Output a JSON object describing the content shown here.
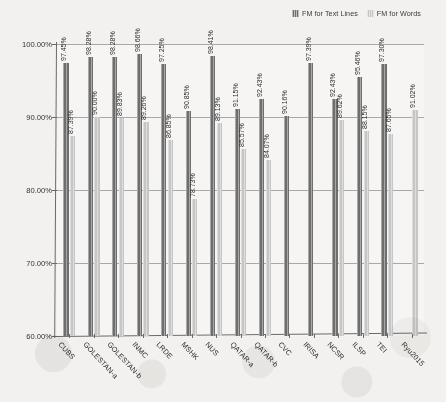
{
  "legend": {
    "position": "top-right",
    "entries": [
      {
        "label": "FM for Text Lines",
        "color": "#6e6e6e",
        "key": "text_lines"
      },
      {
        "label": "FM for Words",
        "color": "#c6c6c6",
        "key": "words"
      }
    ]
  },
  "axes": {
    "y_ticks": [
      "60.00%",
      "70.00%",
      "80.00%",
      "90.00%",
      "100.00%"
    ],
    "y_min": 60,
    "y_max": 100,
    "y_step": 10
  },
  "chart_data": {
    "type": "bar",
    "title": "",
    "xlabel": "",
    "ylabel": "",
    "ylim": [
      60,
      100
    ],
    "grid": true,
    "legend_position": "top-right",
    "categories": [
      "CUBS",
      "GOLESTAN-a",
      "GOLESTAN-b",
      "INMC",
      "LRDE",
      "MSHK",
      "NUS",
      "QATAR-a",
      "QATAR-b",
      "CVC",
      "IRISA",
      "NCSR",
      "ILSP",
      "TEI",
      "Ryu2015"
    ],
    "series": [
      {
        "name": "FM for Text Lines",
        "color": "#6e6e6e",
        "values": [
          97.45,
          98.28,
          98.28,
          98.66,
          97.25,
          90.85,
          98.41,
          91.15,
          92.43,
          90.16,
          97.39,
          92.43,
          95.46,
          97.3,
          null
        ],
        "labels": [
          "97.45%",
          "98.28%",
          "98.28%",
          "98.66%",
          "97.25%",
          "90.85%",
          "98.41%",
          "91.15%",
          "92.43%",
          "90.16%",
          "97.39%",
          "92.43%",
          "95.46%",
          "97.30%",
          null
        ]
      },
      {
        "name": "FM for Words",
        "color": "#c6c6c6",
        "values": [
          87.39,
          90.0,
          89.83,
          89.26,
          86.85,
          78.73,
          89.13,
          85.57,
          84.07,
          null,
          null,
          89.62,
          88.15,
          87.65,
          91.02
        ],
        "labels": [
          "87.39%",
          "90.00%",
          "89.83%",
          "89.26%",
          "86.85%",
          "78.73%",
          "89.13%",
          "85.57%",
          "84.07%",
          null,
          null,
          "89.62%",
          "88.15%",
          "87.65%",
          "91.02%"
        ]
      }
    ]
  }
}
